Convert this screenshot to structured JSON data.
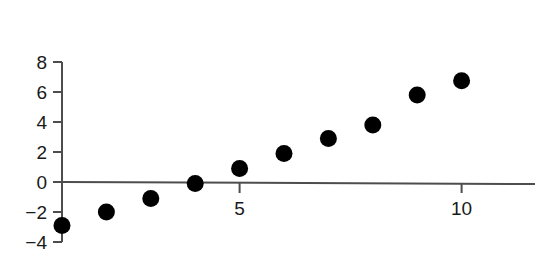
{
  "chart_data": {
    "type": "scatter",
    "title": "",
    "xlabel": "",
    "ylabel": "",
    "x": [
      1,
      2,
      3,
      4,
      5,
      6,
      7,
      8,
      9,
      10
    ],
    "values": [
      -2.9,
      -2.0,
      -1.1,
      -0.1,
      0.9,
      1.9,
      2.9,
      3.8,
      5.8,
      6.75
    ],
    "series": [
      {
        "name": "series-1",
        "x": [
          1,
          2,
          3,
          4,
          5,
          6,
          7,
          8,
          9,
          10
        ],
        "values": [
          -2.9,
          -2.0,
          -1.1,
          -0.1,
          0.9,
          1.9,
          2.9,
          3.8,
          5.8,
          6.75
        ]
      }
    ],
    "xlim": [
      0.6,
      11.3
    ],
    "ylim": [
      -4,
      8
    ],
    "x_ticks": [
      5,
      10
    ],
    "x_tick_labels": [
      "5",
      "10"
    ],
    "y_ticks": [
      -4,
      -2,
      0,
      2,
      4,
      6,
      8
    ],
    "y_tick_labels": [
      "−4",
      "−2",
      "0",
      "2",
      "4",
      "6",
      "8"
    ],
    "grid": false,
    "legend": null,
    "marker": {
      "shape": "circle",
      "color": "#000000",
      "size_px": 17
    },
    "axis_color": "#4d4d4d",
    "background_color": "#ffffff"
  },
  "axes": {
    "y_axis_name": "y-axis",
    "x_axis_name": "x-axis"
  }
}
